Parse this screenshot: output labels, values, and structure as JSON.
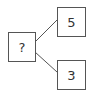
{
  "diagram": {
    "root": {
      "label": "?"
    },
    "children": [
      {
        "label": "5"
      },
      {
        "label": "3"
      }
    ],
    "colors": {
      "border": "#555555",
      "text": "#333333",
      "background": "#ffffff"
    }
  }
}
